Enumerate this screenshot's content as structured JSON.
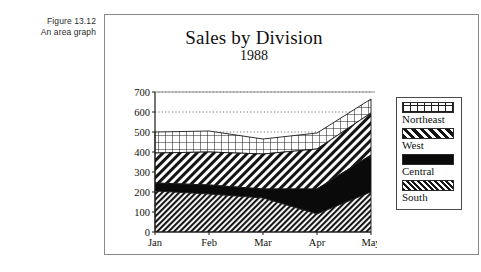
{
  "caption": {
    "line1": "Figure 13.12",
    "line2": "An area graph"
  },
  "chart_data": {
    "type": "area",
    "stacked": true,
    "title": "Sales by Division",
    "subtitle": "1988",
    "xlabel": "",
    "ylabel": "",
    "grid": true,
    "legend_position": "right",
    "ylim": [
      0,
      700
    ],
    "yticks": [
      0,
      100,
      200,
      300,
      400,
      500,
      600,
      700
    ],
    "ytick_labels": [
      "0",
      "100",
      "200",
      "300",
      "400",
      "500",
      "600",
      "700"
    ],
    "categories": [
      "Jan",
      "Feb",
      "Mar",
      "Apr",
      "May"
    ],
    "series": [
      {
        "name": "South",
        "pattern": "dense-diagonal-hatch",
        "values": [
          205,
          190,
          170,
          90,
          200
        ]
      },
      {
        "name": "Central",
        "pattern": "solid-black",
        "values": [
          40,
          45,
          45,
          125,
          185
        ]
      },
      {
        "name": "West",
        "pattern": "diagonal-hatch",
        "values": [
          150,
          165,
          175,
          200,
          210
        ]
      },
      {
        "name": "Northeast",
        "pattern": "grid-hatch",
        "values": [
          105,
          105,
          75,
          80,
          70
        ]
      }
    ],
    "cumulative_tops": {
      "South": [
        205,
        190,
        170,
        90,
        200
      ],
      "Central": [
        245,
        235,
        215,
        215,
        385
      ],
      "West": [
        395,
        400,
        390,
        415,
        595
      ],
      "Northeast": [
        500,
        505,
        465,
        495,
        665
      ]
    },
    "colors": {
      "axis": "#1a1a1a",
      "grid": "#6f6f6f",
      "frame": "#8a8a8a",
      "ink": "#111111"
    }
  },
  "legend": {
    "items": [
      {
        "label": "Northeast"
      },
      {
        "label": "West"
      },
      {
        "label": "Central"
      },
      {
        "label": "South"
      }
    ]
  }
}
